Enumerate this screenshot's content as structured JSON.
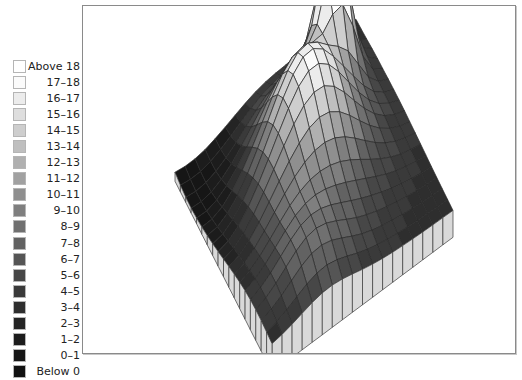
{
  "chart_data": {
    "type": "surface3d",
    "title": "",
    "xlabel": "",
    "ylabel": "",
    "zlabel": "",
    "legend_position": "left",
    "legend": [
      {
        "label": "Above 18",
        "color": "#ffffff"
      },
      {
        "label": "17–18",
        "color": "#fbfbfb"
      },
      {
        "label": "16–17",
        "color": "#ececec"
      },
      {
        "label": "15–16",
        "color": "#dedede"
      },
      {
        "label": "14–15",
        "color": "#cecece"
      },
      {
        "label": "13–14",
        "color": "#bfbfbf"
      },
      {
        "label": "12–13",
        "color": "#b0b0b0"
      },
      {
        "label": "11–12",
        "color": "#a1a1a1"
      },
      {
        "label": "10–11",
        "color": "#8f8f8f"
      },
      {
        "label": "9–10",
        "color": "#7f7f7f"
      },
      {
        "label": "8–9",
        "color": "#707070"
      },
      {
        "label": "7–8",
        "color": "#626262"
      },
      {
        "label": "6–7",
        "color": "#555555"
      },
      {
        "label": "5–6",
        "color": "#474747"
      },
      {
        "label": "4–5",
        "color": "#3a3a3a"
      },
      {
        "label": "3–4",
        "color": "#2e2e2e"
      },
      {
        "label": "2–3",
        "color": "#242424"
      },
      {
        "label": "1–2",
        "color": "#1c1c1c"
      },
      {
        "label": "0–1",
        "color": "#161616"
      },
      {
        "label": "Below 0",
        "color": "#111111"
      }
    ],
    "bins": [
      18,
      17,
      16,
      15,
      14,
      13,
      12,
      11,
      10,
      9,
      8,
      7,
      6,
      5,
      4,
      3,
      2,
      1,
      0
    ],
    "grid_size": [
      18,
      18
    ],
    "zlim": [
      0,
      20
    ],
    "surface": {
      "base": 3.5,
      "features": [
        {
          "name": "main-peak",
          "cx": 0.78,
          "cy": 0.18,
          "height": 17.5,
          "sx": 0.07,
          "sy": 0.08
        },
        {
          "name": "secondary-peak",
          "cx": 0.55,
          "cy": 0.36,
          "height": 10.5,
          "sx": 0.17,
          "sy": 0.16
        },
        {
          "name": "ridge",
          "cx": 0.42,
          "cy": 0.55,
          "height": 5.5,
          "sx": 0.25,
          "sy": 0.22
        },
        {
          "name": "right-shoulder",
          "cx": 0.3,
          "cy": 0.85,
          "height": 3.2,
          "sx": 0.14,
          "sy": 0.12
        },
        {
          "name": "left-trough",
          "cx": 0.1,
          "cy": 0.1,
          "height": -2.8,
          "sx": 0.2,
          "sy": 0.2
        },
        {
          "name": "front-trough",
          "cx": 0.05,
          "cy": 0.45,
          "height": -2.4,
          "sx": 0.14,
          "sy": 0.2
        }
      ]
    }
  }
}
